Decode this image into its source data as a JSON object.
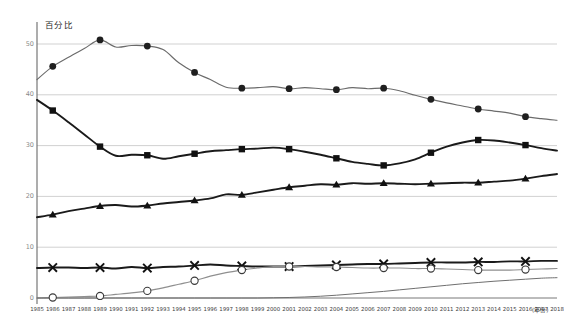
{
  "chart_data": {
    "type": "line",
    "title": "",
    "subtitle": "",
    "xlabel": "(年份)",
    "ylabel": "百分比",
    "grid": true,
    "legend_position": "none",
    "xlim": [
      1985,
      2018
    ],
    "ylim": [
      0,
      53
    ],
    "yticks": [
      0,
      10,
      20,
      30,
      40,
      50
    ],
    "ytick_labels": [
      "0",
      "10",
      "20",
      "30",
      "40",
      "50"
    ],
    "x": [
      1985,
      1986,
      1987,
      1988,
      1989,
      1990,
      1991,
      1992,
      1993,
      1994,
      1995,
      1996,
      1997,
      1998,
      1999,
      2000,
      2001,
      2002,
      2003,
      2004,
      2005,
      2006,
      2007,
      2008,
      2009,
      2010,
      2011,
      2012,
      2013,
      2014,
      2015,
      2016,
      2017,
      2018
    ],
    "categories": [
      "1985",
      "1986",
      "1987",
      "1988",
      "1989",
      "1990",
      "1991",
      "1992",
      "1993",
      "1994",
      "1995",
      "1996",
      "1997",
      "1998",
      "1999",
      "2000",
      "2001",
      "2002",
      "2003",
      "2004",
      "2005",
      "2006",
      "2007",
      "2008",
      "2009",
      "2010",
      "2011",
      "2012",
      "2013",
      "2014",
      "2015",
      "2016",
      "2017",
      "2018"
    ],
    "series": [
      {
        "name": "series-circle-filled",
        "marker": "circle-filled",
        "color": "#6b6b6b",
        "marker_interval": 3,
        "marker_start_year": 1986,
        "values": [
          43.0,
          45.6,
          47.4,
          49.1,
          50.8,
          49.4,
          49.7,
          49.6,
          48.9,
          46.3,
          44.4,
          43.0,
          41.5,
          41.3,
          41.4,
          41.6,
          41.2,
          41.4,
          41.2,
          41.0,
          41.4,
          41.2,
          41.3,
          40.8,
          39.9,
          39.1,
          38.4,
          37.8,
          37.2,
          36.8,
          36.4,
          35.7,
          35.3,
          35.0
        ]
      },
      {
        "name": "series-square-filled",
        "marker": "square-filled",
        "color": "#1a1a1a",
        "marker_interval": 3,
        "marker_start_year": 1986,
        "values": [
          39.0,
          36.9,
          34.6,
          32.2,
          29.8,
          28.0,
          28.2,
          28.1,
          27.4,
          27.9,
          28.4,
          28.9,
          29.1,
          29.3,
          29.4,
          29.6,
          29.3,
          28.8,
          28.2,
          27.5,
          26.8,
          26.4,
          26.1,
          26.5,
          27.3,
          28.6,
          29.8,
          30.6,
          31.1,
          31.0,
          30.6,
          30.1,
          29.5,
          29.0
        ]
      },
      {
        "name": "series-triangle-filled",
        "marker": "triangle-filled",
        "color": "#1a1a1a",
        "marker_interval": 3,
        "marker_start_year": 1986,
        "values": [
          15.9,
          16.4,
          17.1,
          17.6,
          18.1,
          18.3,
          18.0,
          18.2,
          18.6,
          18.9,
          19.2,
          19.6,
          20.4,
          20.3,
          20.8,
          21.3,
          21.8,
          22.1,
          22.4,
          22.3,
          22.6,
          22.5,
          22.6,
          22.5,
          22.4,
          22.5,
          22.6,
          22.7,
          22.7,
          22.9,
          23.1,
          23.5,
          24.0,
          24.4
        ]
      },
      {
        "name": "series-cross",
        "marker": "cross",
        "color": "#1a1a1a",
        "marker_interval": 3,
        "marker_start_year": 1986,
        "values": [
          5.9,
          6.0,
          6.0,
          5.9,
          6.0,
          5.8,
          6.1,
          5.9,
          6.1,
          6.2,
          6.4,
          6.6,
          6.4,
          6.3,
          6.2,
          6.2,
          6.2,
          6.3,
          6.4,
          6.5,
          6.6,
          6.7,
          6.7,
          6.8,
          6.9,
          7.0,
          7.0,
          7.0,
          7.1,
          7.1,
          7.2,
          7.2,
          7.3,
          7.3
        ]
      },
      {
        "name": "series-circle-open",
        "marker": "circle-open",
        "color": "#8f8f8f",
        "marker_interval": 3,
        "marker_start_year": 1986,
        "values": [
          0.0,
          0.1,
          0.2,
          0.3,
          0.4,
          0.7,
          1.0,
          1.4,
          2.0,
          2.7,
          3.4,
          4.3,
          5.0,
          5.5,
          5.9,
          6.2,
          6.2,
          6.2,
          6.1,
          6.1,
          6.0,
          5.9,
          5.9,
          5.9,
          5.8,
          5.8,
          5.7,
          5.6,
          5.5,
          5.5,
          5.5,
          5.6,
          5.7,
          5.8
        ]
      },
      {
        "name": "series-plain-gray",
        "marker": "none",
        "color": "#6f6f6f",
        "values": [
          0.0,
          0.0,
          0.0,
          0.0,
          0.0,
          0.0,
          0.0,
          0.0,
          0.0,
          0.0,
          0.0,
          0.0,
          0.0,
          0.0,
          0.0,
          0.05,
          0.1,
          0.2,
          0.35,
          0.55,
          0.8,
          1.05,
          1.3,
          1.6,
          1.9,
          2.2,
          2.5,
          2.8,
          3.05,
          3.3,
          3.5,
          3.7,
          3.9,
          4.0
        ]
      }
    ]
  },
  "axis": {
    "y_unit": "百分比",
    "x_title": "(年份)"
  }
}
